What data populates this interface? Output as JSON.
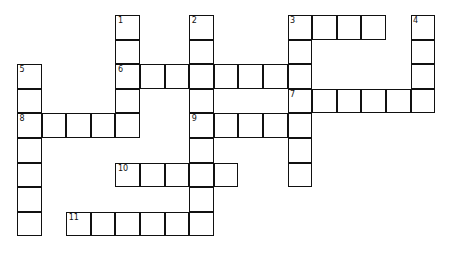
{
  "puzzle": {
    "type": "crossword",
    "cell_size": 24.6,
    "origin": [
      17,
      15
    ],
    "clues": [
      {
        "number": "1",
        "direction": "down",
        "row": 0,
        "col": 4,
        "length": 5
      },
      {
        "number": "2",
        "direction": "down",
        "row": 0,
        "col": 7,
        "length": 9
      },
      {
        "number": "3",
        "direction": "across",
        "row": 0,
        "col": 11,
        "length": 4
      },
      {
        "number": "3",
        "direction": "down",
        "row": 0,
        "col": 11,
        "length": 7
      },
      {
        "number": "4",
        "direction": "down",
        "row": 0,
        "col": 16,
        "length": 4
      },
      {
        "number": "5",
        "direction": "down",
        "row": 2,
        "col": 0,
        "length": 7
      },
      {
        "number": "6",
        "direction": "across",
        "row": 2,
        "col": 4,
        "length": 8
      },
      {
        "number": "7",
        "direction": "across",
        "row": 3,
        "col": 11,
        "length": 6
      },
      {
        "number": "8",
        "direction": "across",
        "row": 4,
        "col": 0,
        "length": 5
      },
      {
        "number": "9",
        "direction": "across",
        "row": 4,
        "col": 7,
        "length": 5
      },
      {
        "number": "10",
        "direction": "across",
        "row": 6,
        "col": 4,
        "length": 5
      },
      {
        "number": "11",
        "direction": "across",
        "row": 8,
        "col": 2,
        "length": 6
      }
    ],
    "labels": [
      {
        "number": "1",
        "row": 0,
        "col": 4
      },
      {
        "number": "2",
        "row": 0,
        "col": 7
      },
      {
        "number": "3",
        "row": 0,
        "col": 11
      },
      {
        "number": "4",
        "row": 0,
        "col": 16
      },
      {
        "number": "5",
        "row": 2,
        "col": 0
      },
      {
        "number": "6",
        "row": 2,
        "col": 4
      },
      {
        "number": "7",
        "row": 3,
        "col": 11
      },
      {
        "number": "8",
        "row": 4,
        "col": 0
      },
      {
        "number": "9",
        "row": 4,
        "col": 7
      },
      {
        "number": "10",
        "row": 6,
        "col": 4
      },
      {
        "number": "11",
        "row": 8,
        "col": 2
      }
    ]
  }
}
